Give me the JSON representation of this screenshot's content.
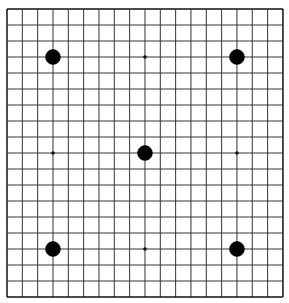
{
  "board": {
    "size": 19,
    "origin": [
      7,
      9
    ],
    "spacing": [
      15.33,
      16.0
    ],
    "line_color": "#333333",
    "border_color": "#111111",
    "background": "#ffffff",
    "star_points": [
      [
        3,
        3
      ],
      [
        9,
        3
      ],
      [
        15,
        3
      ],
      [
        3,
        9
      ],
      [
        9,
        9
      ],
      [
        15,
        9
      ],
      [
        3,
        15
      ],
      [
        9,
        15
      ],
      [
        15,
        15
      ]
    ],
    "stones": [
      {
        "col": 3,
        "row": 3,
        "color": "black"
      },
      {
        "col": 15,
        "row": 3,
        "color": "black"
      },
      {
        "col": 9,
        "row": 9,
        "color": "black"
      },
      {
        "col": 3,
        "row": 15,
        "color": "black"
      },
      {
        "col": 15,
        "row": 15,
        "color": "black"
      }
    ]
  }
}
